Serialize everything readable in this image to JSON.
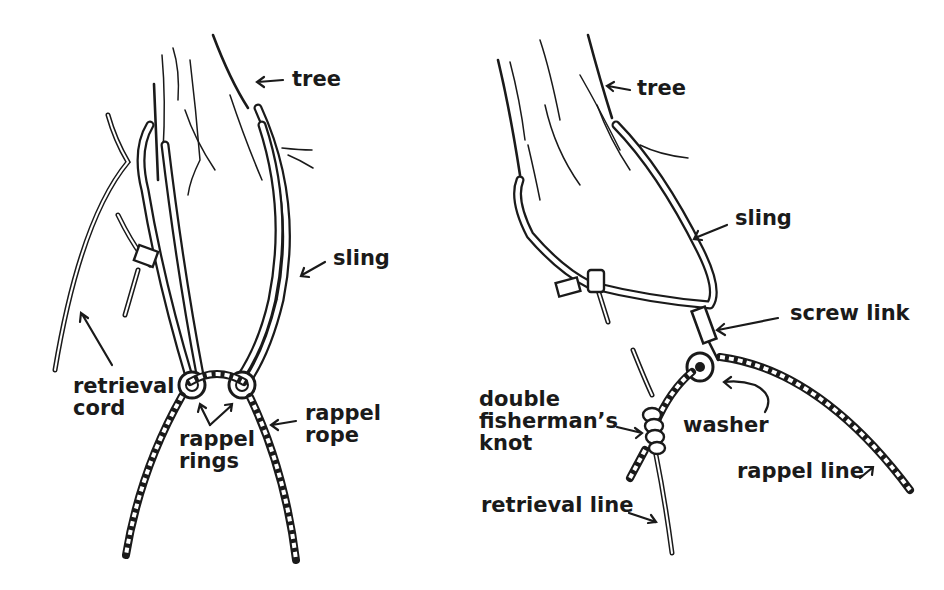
{
  "diagram": {
    "left_panel": {
      "labels": {
        "tree": "tree",
        "sling": "sling",
        "retrieval_cord_1": "retrieval",
        "retrieval_cord_2": "cord",
        "rappel_rings_1": "rappel",
        "rappel_rings_2": "rings",
        "rappel_rope_1": "rappel",
        "rappel_rope_2": "rope"
      }
    },
    "right_panel": {
      "labels": {
        "tree": "tree",
        "sling": "sling",
        "screw_link": "screw link",
        "washer": "washer",
        "knot_1": "double",
        "knot_2": "fisherman’s",
        "knot_3": "knot",
        "rappel_line": "rappel line",
        "retrieval_line": "retrieval line"
      }
    },
    "colors": {
      "ink": "#1a1a1a",
      "background": "#ffffff"
    }
  }
}
